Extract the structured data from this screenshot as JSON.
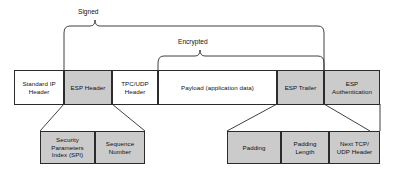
{
  "diagram": {
    "colors": {
      "shaded_fill": "#cbcbcb",
      "plain_fill": "#ffffff",
      "stroke": "#2b2b2b",
      "text": "#111111"
    },
    "braces": [
      {
        "label": "Signed",
        "span_from": "ESP Header",
        "span_to": "ESP Trailer"
      },
      {
        "label": "Encrypted",
        "span_from": "Payload (application data)",
        "span_to": "ESP Trailer"
      }
    ],
    "packet_fields": [
      {
        "label": "Standard IP\nHeader",
        "shaded": false
      },
      {
        "label": "ESP Header",
        "shaded": true
      },
      {
        "label": "TPC/UDP\nHeader",
        "shaded": false
      },
      {
        "label": "Payload (application data)",
        "shaded": false
      },
      {
        "label": "ESP Trailer",
        "shaded": true
      },
      {
        "label": "ESP\nAuthentication",
        "shaded": true
      }
    ],
    "esp_header_detail": [
      {
        "label": "Security\nParameters\nIndex (SPI)",
        "shaded": true
      },
      {
        "label": "Sequence\nNumber",
        "shaded": true
      }
    ],
    "esp_trailer_detail": [
      {
        "label": "Padding",
        "shaded": true
      },
      {
        "label": "Padding\nLength",
        "shaded": true
      },
      {
        "label": "Next TCP/\nUDP Header",
        "shaded": true
      }
    ]
  }
}
